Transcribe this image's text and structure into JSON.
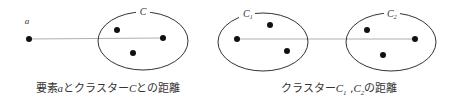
{
  "left_diagram": {
    "point_label": "a",
    "cluster_label": "C",
    "caption_pre": "要素",
    "caption_var": "a",
    "caption_mid": "とクラスター",
    "caption_var2": "C",
    "caption_post": "との距離"
  },
  "right_diagram": {
    "cluster1_label": "C",
    "cluster1_sub": "1",
    "cluster2_label": "C",
    "cluster2_sub": "2",
    "caption_pre": "クラスター",
    "caption_var1": "C",
    "caption_sub1": "1",
    "caption_sep": " ,",
    "caption_var2": "C",
    "caption_sub2": "2",
    "caption_post": "の距離"
  },
  "colors": {
    "stroke": "#333333",
    "line": "#999999",
    "dot": "#111111"
  }
}
